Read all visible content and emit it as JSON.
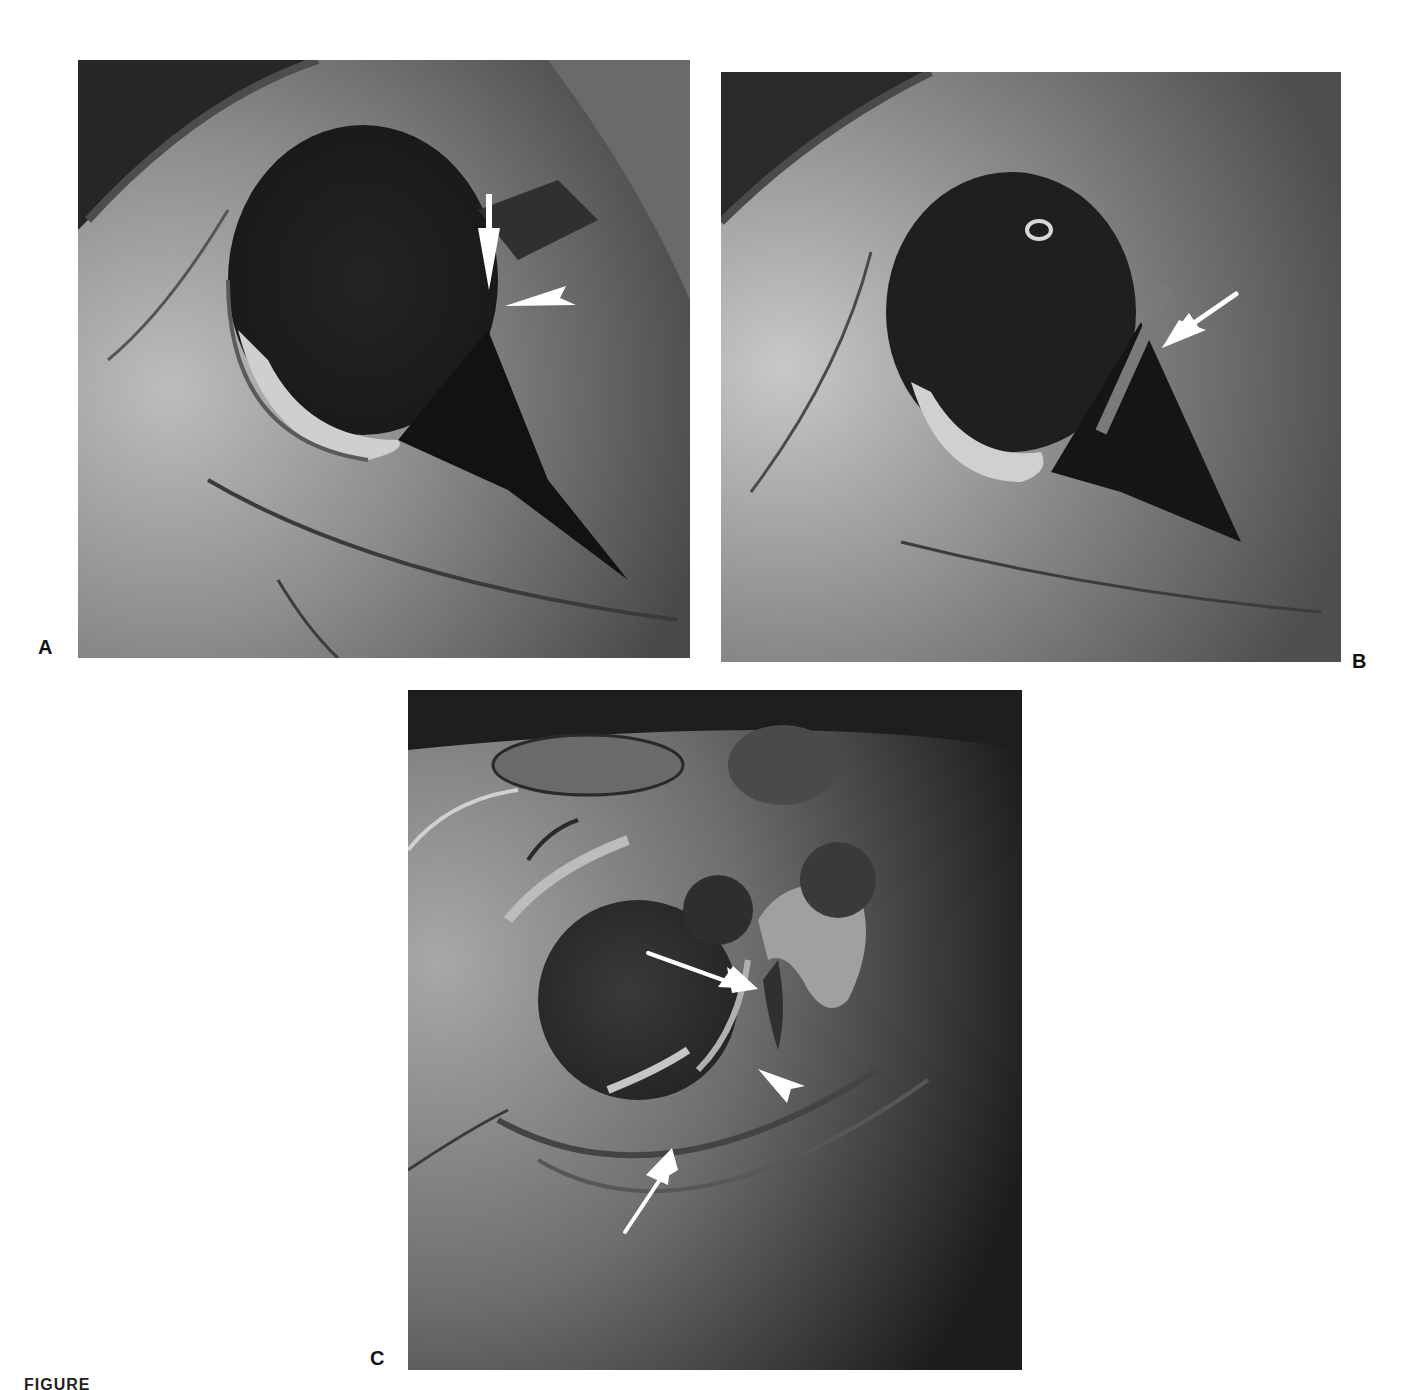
{
  "figure": {
    "caption_visible": "FIGURE",
    "background_color": "#ffffff",
    "label_color": "#111111"
  },
  "panels": [
    {
      "label": "A",
      "annotations": [
        {
          "type": "arrow",
          "direction": "down",
          "color": "#ffffff"
        },
        {
          "type": "arrowhead",
          "direction": "left",
          "color": "#ffffff"
        }
      ]
    },
    {
      "label": "B",
      "annotations": [
        {
          "type": "arrow",
          "direction": "down-left",
          "color": "#ffffff"
        }
      ]
    },
    {
      "label": "C",
      "annotations": [
        {
          "type": "arrow",
          "direction": "down-right",
          "color": "#ffffff"
        },
        {
          "type": "arrowhead",
          "direction": "up-left",
          "color": "#ffffff"
        },
        {
          "type": "arrow",
          "direction": "up-right",
          "color": "#ffffff"
        }
      ]
    }
  ]
}
